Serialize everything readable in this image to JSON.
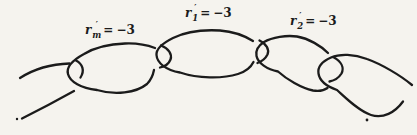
{
  "figure": {
    "colors": {
      "ink": "#1b1b1b",
      "paper": "#f5f3ee"
    },
    "labels": [
      {
        "base": "r",
        "prime": "′",
        "sub": "m",
        "rel": "=",
        "value": "−3"
      },
      {
        "base": "r",
        "prime": "′",
        "sub": "1",
        "rel": "=",
        "value": "−3"
      },
      {
        "base": "r",
        "prime": "′",
        "sub": "2",
        "rel": "=",
        "value": "−3"
      }
    ],
    "links": [
      {
        "name": "left-partial-link",
        "paths": [
          "M 20,78 C 34,69 52,64 69.5,63.5",
          "M 76,60.5 C 82.5,64 85,70.5 80.5,77.5",
          "M 74,91 C 57,100.5 38,110.5 22,118.5"
        ]
      },
      {
        "name": "link-r-m",
        "paths": [
          "M 155,48 C 147,45 136,43 125,43.5 C 110,44 94,48 84,54 C 73,60 66,67 68,74 C 70,82 81,88 97,90 C 115,95.5 136,93 147,84 C 151,80 153,75 154,70",
          "M 161,45.5 C 168.5,48.5 172.5,54 170.5,59.5 C 169,63.5 164.5,66.5 160,67.5"
        ]
      },
      {
        "name": "link-r-1",
        "paths": [
          "M 253,41 C 245,36 233,31.5 220,30.5 C 203,29.5 185,32 173,38 C 163,43 156,49 156.5,55 C 157,63 166,70 180,72.5 C 198,78.5 222,79 238,74 C 246,71.5 251,67 253.5,62",
          "M 259.5,40.5 C 266.5,44 269.5,49.5 267.5,54.5 C 265.5,58.5 261.5,61.5 257.5,63"
        ]
      },
      {
        "name": "link-r-2",
        "paths": [
          "M 328,53 C 321,46 309,38.5 297,36.5 C 287,35 272,37 264,42 C 257,46.5 255.5,51 256.5,56 C 258,63 267,69.5 278,71.5 C 287,79.5 301,88 313,90.5 C 319,91.5 324,90.5 327.5,88",
          "M 334,57.5 C 341,61.5 344.5,67.5 341.5,73.5 C 339,77.5 334.5,80.5 329.5,81.5"
        ]
      },
      {
        "name": "right-partial-link",
        "paths": [
          "M 412,85 C 400,75 381,64 367,59 C 354,54 340,53.5 331,57.5 C 322,61.5 317.5,67.5 318.5,73.5 C 319.5,80.5 327,86.5 337,90 C 347,99 359,111 371,115 C 383,119 395,112.5 403,101.5"
        ]
      }
    ],
    "specks": [
      {
        "x": 17,
        "y": 119,
        "r": 1.2
      },
      {
        "x": 367,
        "y": 120,
        "r": 1.4
      }
    ]
  }
}
